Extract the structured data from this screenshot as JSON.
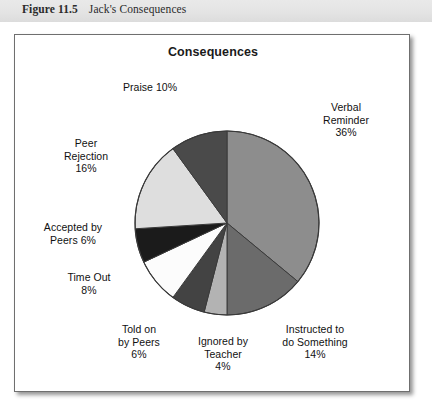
{
  "caption": {
    "figure_label": "Figure 11.5",
    "figure_title": "Jack's Consequences"
  },
  "chart_data": {
    "type": "pie",
    "title": "Consequences",
    "xlabel": "",
    "ylabel": "",
    "legend_position": "none",
    "grid": false,
    "start_angle_deg": 0,
    "direction": "clockwise",
    "categories": [
      "Verbal Reminder",
      "Instructed to do Something",
      "Ignored by Teacher",
      "Told on by Peers",
      "Time Out",
      "Accepted by Peers",
      "Peer Rejection",
      "Praise"
    ],
    "values": [
      36,
      14,
      4,
      6,
      8,
      6,
      16,
      10
    ],
    "units": "percent",
    "total": 100,
    "slices": [
      {
        "name": "Verbal Reminder",
        "value": 36,
        "label": "Verbal\nReminder\n36%",
        "color": "#8d8d8d"
      },
      {
        "name": "Instructed to do Something",
        "value": 14,
        "label": "Instructed to\ndo Something\n14%",
        "color": "#6b6b6b"
      },
      {
        "name": "Ignored by Teacher",
        "value": 4,
        "label": "Ignored by\nTeacher\n4%",
        "color": "#b3b3b3"
      },
      {
        "name": "Told on by Peers",
        "value": 6,
        "label": "Told on\nby Peers\n6%",
        "color": "#434343"
      },
      {
        "name": "Time Out",
        "value": 8,
        "label": "Time Out\n8%",
        "color": "#fcfcfc"
      },
      {
        "name": "Accepted by Peers",
        "value": 6,
        "label": "Accepted by\nPeers 6%",
        "color": "#1b1b1b"
      },
      {
        "name": "Peer Rejection",
        "value": 16,
        "label": "Peer\nRejection\n16%",
        "color": "#dedede"
      },
      {
        "name": "Praise",
        "value": 10,
        "label": "Praise 10%",
        "color": "#4a4a4a"
      }
    ],
    "colors": {
      "outline": "#3a3a3a",
      "panel_background": "#ffffff",
      "panel_border": "#6f6f6f",
      "caption_background": "#e4e4e4",
      "text": "#111111"
    },
    "geometry": {
      "center_x": 212,
      "center_y": 188,
      "radius": 92
    }
  }
}
